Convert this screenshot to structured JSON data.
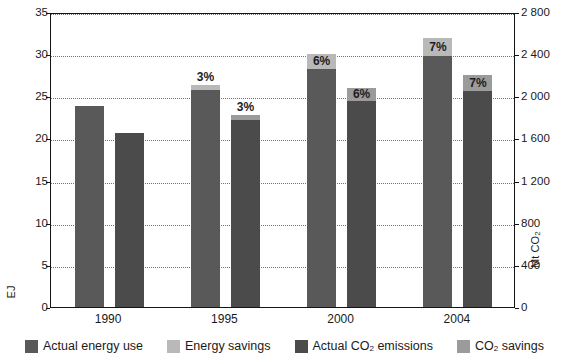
{
  "chart_data": {
    "type": "bar",
    "title": "",
    "subtitle": "",
    "xlabel": "",
    "categories": [
      "1990",
      "1995",
      "2000",
      "2004"
    ],
    "grid": true,
    "legend_position": "bottom",
    "axes": {
      "left": {
        "label_text": "EJ",
        "label_plain": "EJ",
        "min": 0,
        "max": 35,
        "step": 5,
        "ticks": [
          "0",
          "5",
          "10",
          "15",
          "20",
          "25",
          "30",
          "35"
        ],
        "tick_values": [
          0,
          5,
          10,
          15,
          20,
          25,
          30,
          35
        ]
      },
      "right": {
        "label_main": "Mt CO",
        "label_sub": "2",
        "label_plain": "Mt CO2",
        "min": 0,
        "max": 2800,
        "step": 400,
        "ticks": [
          "0",
          "400",
          "800",
          "1 200",
          "1 600",
          "2 000",
          "2 400",
          "2 800"
        ],
        "tick_values": [
          0,
          400,
          800,
          1200,
          1600,
          2000,
          2400,
          2800
        ]
      }
    },
    "series": [
      {
        "name": "Actual energy use",
        "axis": "left",
        "unit": "EJ",
        "color": "#595959",
        "values": [
          23.9,
          25.7,
          28.3,
          29.8
        ]
      },
      {
        "name": "Energy savings",
        "axis": "left",
        "unit": "EJ",
        "color": "#b9b9b9",
        "values": [
          0,
          0.7,
          1.7,
          2.1
        ],
        "labels": [
          "",
          "3%",
          "6%",
          "7%"
        ]
      },
      {
        "name": "Actual CO2 emissions",
        "axis": "right",
        "unit": "Mt CO2",
        "color": "#4b4b4b",
        "values": [
          1655,
          1780,
          1960,
          2050
        ]
      },
      {
        "name": "CO2 savings",
        "axis": "right",
        "unit": "Mt CO2",
        "color": "#9b9b9b",
        "values": [
          0,
          45,
          115,
          155
        ],
        "labels": [
          "",
          "3%",
          "6%",
          "7%"
        ]
      }
    ],
    "groups": [
      {
        "category": "1990",
        "energy": {
          "actual": 23.9,
          "savings": 0,
          "savings_label": "",
          "label_position": "none"
        },
        "co2": {
          "actual": 1655,
          "savings": 0,
          "savings_label": "",
          "label_position": "none"
        }
      },
      {
        "category": "1995",
        "energy": {
          "actual": 25.7,
          "savings": 0.7,
          "savings_label": "3%",
          "label_position": "above"
        },
        "co2": {
          "actual": 1780,
          "savings": 45,
          "savings_label": "3%",
          "label_position": "above"
        }
      },
      {
        "category": "2000",
        "energy": {
          "actual": 28.3,
          "savings": 1.7,
          "savings_label": "6%",
          "label_position": "inside"
        },
        "co2": {
          "actual": 1960,
          "savings": 115,
          "savings_label": "6%",
          "label_position": "inside"
        }
      },
      {
        "category": "2004",
        "energy": {
          "actual": 29.8,
          "savings": 2.1,
          "savings_label": "7%",
          "label_position": "inside"
        },
        "co2": {
          "actual": 2050,
          "savings": 155,
          "savings_label": "7%",
          "label_position": "inside"
        }
      }
    ],
    "legend": [
      {
        "label_main": "Actual energy use",
        "label_sub": "",
        "label_suffix": "",
        "color": "#595959"
      },
      {
        "label_main": "Energy savings",
        "label_sub": "",
        "label_suffix": "",
        "color": "#b9b9b9"
      },
      {
        "label_main": "Actual CO",
        "label_sub": "2",
        "label_suffix": " emissions",
        "color": "#4b4b4b"
      },
      {
        "label_main": "CO",
        "label_sub": "2",
        "label_suffix": " savings",
        "color": "#9b9b9b"
      }
    ],
    "colors": {
      "actual_energy": "#595959",
      "energy_savings": "#b9b9b9",
      "actual_co2": "#4b4b4b",
      "co2_savings": "#9b9b9b",
      "grid": "#6f6f8a",
      "frame": "#141414",
      "text": "#1a1a1a",
      "background": "#ffffff"
    }
  }
}
